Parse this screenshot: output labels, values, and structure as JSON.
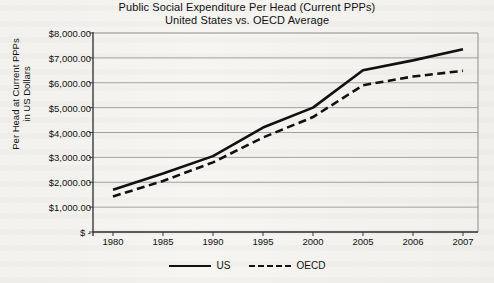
{
  "chart_data": {
    "type": "line",
    "title": "Public Social Expenditure Per Head (Current PPPs)",
    "subtitle": "United States vs. OECD Average",
    "xlabel": "",
    "ylabel": "Per Head at Current PPPs in US Dollars",
    "ylabel_line1": "Per Head at Current PPPs",
    "ylabel_line2": "in US Dollars",
    "categories": [
      "1980",
      "1985",
      "1990",
      "1995",
      "2000",
      "2005",
      "2006",
      "2007"
    ],
    "series": [
      {
        "name": "US",
        "style": "solid",
        "values": [
          1700,
          2350,
          3050,
          4200,
          5000,
          6500,
          6900,
          7350
        ]
      },
      {
        "name": "OECD",
        "style": "dashed",
        "values": [
          1430,
          2050,
          2800,
          3800,
          4620,
          5900,
          6250,
          6480
        ]
      }
    ],
    "ylim": [
      0,
      8000
    ],
    "ytick_values": [
      8000,
      7000,
      6000,
      5000,
      4000,
      3000,
      2000,
      1000,
      0
    ],
    "ytick_labels": [
      "$8,000.00",
      "$7,000.00",
      "$6,000.00",
      "$5,000.00",
      "$4,000.00",
      "$3,000.00",
      "$2,000.00",
      "$1,000.00",
      "$ -"
    ],
    "grid": true,
    "legend_position": "bottom",
    "legend": [
      "US",
      "OECD"
    ],
    "line_color": "#111111"
  },
  "plot_geometry": {
    "left": 93,
    "right": 478,
    "top": 33,
    "bottom": 232,
    "first_category_x": 113,
    "category_spacing": 50
  }
}
